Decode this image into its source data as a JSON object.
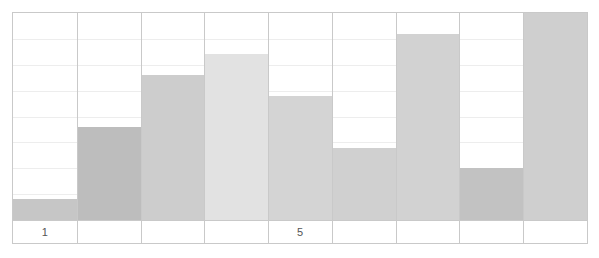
{
  "chart_data": {
    "type": "bar",
    "title": "",
    "subtitle": "",
    "xlabel": "",
    "ylabel": "",
    "categories": [
      "1",
      "2",
      "3",
      "4",
      "5",
      "6",
      "7",
      "8",
      "9"
    ],
    "values": [
      1,
      4.5,
      7,
      8,
      6,
      3.5,
      9,
      2.5,
      10
    ],
    "tick_labels_shown": [
      "1",
      "",
      "",
      "",
      "5",
      "",
      "",
      "",
      ""
    ],
    "ylim": [
      0,
      10
    ],
    "xlim": [
      0.5,
      9.5
    ],
    "grid": {
      "horizontal": true,
      "vertical": true,
      "horizontal_divisions": 8,
      "vertical_divisions": 9
    },
    "legend": {
      "visible": false,
      "position": "none",
      "entries": []
    },
    "bar_colors": [
      "#c6c6c6",
      "#bdbdbd",
      "#cdcdcd",
      "#e2e2e2",
      "#d4d4d4",
      "#d0d0d0",
      "#d2d2d2",
      "#c2c2c2",
      "#cfcfcf"
    ],
    "annotations": []
  },
  "axes": {
    "x_ticks": [
      {
        "index": 0,
        "label": "1"
      },
      {
        "index": 1,
        "label": ""
      },
      {
        "index": 2,
        "label": ""
      },
      {
        "index": 3,
        "label": ""
      },
      {
        "index": 4,
        "label": "5"
      },
      {
        "index": 5,
        "label": ""
      },
      {
        "index": 6,
        "label": ""
      },
      {
        "index": 7,
        "label": ""
      },
      {
        "index": 8,
        "label": ""
      }
    ]
  },
  "style": {
    "frame_color": "#c9c9c9",
    "gridline_color": "#ededed",
    "background": "#ffffff",
    "tick_label_color": "#555555"
  }
}
